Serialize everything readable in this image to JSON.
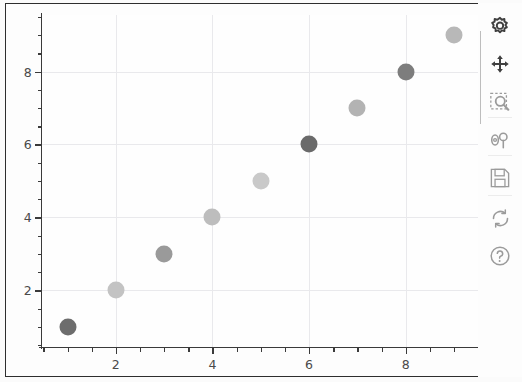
{
  "window": {
    "title": "Scatter Plot Viewer"
  },
  "chart_data": {
    "type": "scatter",
    "title": "",
    "xlabel": "",
    "ylabel": "",
    "xlim": [
      0.45,
      9.62
    ],
    "ylim": [
      0.42,
      9.55
    ],
    "grid": true,
    "legend": null,
    "x_major_ticks": [
      2,
      4,
      6,
      8
    ],
    "y_major_ticks": [
      2,
      4,
      6,
      8
    ],
    "x_tick_labels": [
      "2",
      "4",
      "6",
      "8"
    ],
    "y_tick_labels": [
      "2",
      "4",
      "6",
      "8"
    ],
    "x_minor_step": 0.5,
    "y_minor_step": 0.5,
    "marker": "circle",
    "marker_size_px": 17,
    "points": [
      {
        "x": 1,
        "y": 1,
        "color": "#6d6d6d"
      },
      {
        "x": 2,
        "y": 2,
        "color": "#c3c3c3"
      },
      {
        "x": 3,
        "y": 3,
        "color": "#9a9a9a"
      },
      {
        "x": 4,
        "y": 4,
        "color": "#bdbdbd"
      },
      {
        "x": 5,
        "y": 5,
        "color": "#c9c9c9"
      },
      {
        "x": 6,
        "y": 6,
        "color": "#6a6a6a"
      },
      {
        "x": 7,
        "y": 7,
        "color": "#b3b3b3"
      },
      {
        "x": 8,
        "y": 8,
        "color": "#7d7d7d"
      },
      {
        "x": 9,
        "y": 9,
        "color": "#b8b8b8"
      }
    ],
    "series": [
      {
        "name": "points",
        "x": [
          1,
          2,
          3,
          4,
          5,
          6,
          7,
          8,
          9
        ],
        "values": [
          1,
          2,
          3,
          4,
          5,
          6,
          7,
          8,
          9
        ]
      }
    ]
  },
  "colors": {
    "figure_border": "#2e2e2e",
    "canvas_background": "#fdfdfd",
    "gridline": "#e9e9ec",
    "axis": "#3a3a3a",
    "tick_label": "#4a4a4a",
    "toolbar_icon": "#3f3f3f",
    "toolbar_icon_muted": "#9b9b9b"
  },
  "toolbar": {
    "items": [
      {
        "icon": "configure-icon",
        "label": "Configure",
        "top": 6,
        "tone": "dark"
      },
      {
        "icon": "move-icon",
        "label": "Pan / Move",
        "top": 44,
        "tone": "dark"
      },
      {
        "icon": "zoom-rect-icon",
        "label": "Zoom to rectangle",
        "top": 82,
        "tone": "muted"
      },
      {
        "icon": "subplot-sliders-icon",
        "label": "Configure subplots",
        "top": 120,
        "tone": "muted"
      },
      {
        "icon": "save-icon",
        "label": "Save figure",
        "top": 158,
        "tone": "muted"
      },
      {
        "icon": "refresh-icon",
        "label": "Reset view",
        "top": 198,
        "tone": "muted"
      },
      {
        "icon": "help-icon",
        "label": "Help",
        "top": 236,
        "tone": "muted"
      }
    ],
    "separators": [
      114,
      152,
      192
    ]
  }
}
